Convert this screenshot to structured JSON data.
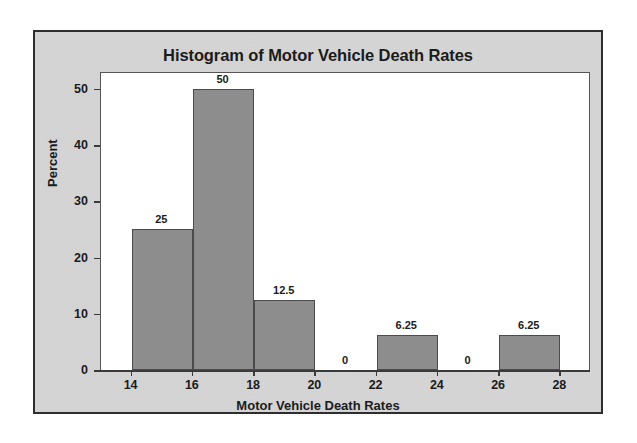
{
  "figure": {
    "background_color": "#d5d5d5",
    "frame_color": "#2e2e2e",
    "plot_background": "#ffffff"
  },
  "chart_data": {
    "type": "bar",
    "title": "Histogram of Motor Vehicle Death Rates",
    "xlabel": "Motor Vehicle Death Rates",
    "ylabel": "Percent",
    "xlim": [
      13.0,
      29.0
    ],
    "ylim": [
      0,
      53
    ],
    "grid": false,
    "legend": "none",
    "bar_color": "#8d8d8d",
    "bar_edge_color": "#4b4b4b",
    "bin_width": 2,
    "xticks": [
      14,
      16,
      18,
      20,
      22,
      24,
      26,
      28
    ],
    "xtick_labels": [
      "14",
      "16",
      "18",
      "20",
      "22",
      "24",
      "26",
      "28"
    ],
    "yticks": [
      0,
      10,
      20,
      30,
      40,
      50
    ],
    "ytick_labels": [
      "0",
      "10",
      "20",
      "30",
      "40",
      "50"
    ],
    "bins": [
      {
        "start": 14,
        "end": 16,
        "value": 25,
        "label": "25"
      },
      {
        "start": 16,
        "end": 18,
        "value": 50,
        "label": "50"
      },
      {
        "start": 18,
        "end": 20,
        "value": 12.5,
        "label": "12.5"
      },
      {
        "start": 20,
        "end": 22,
        "value": 0,
        "label": "0"
      },
      {
        "start": 22,
        "end": 24,
        "value": 6.25,
        "label": "6.25"
      },
      {
        "start": 24,
        "end": 26,
        "value": 0,
        "label": "0"
      },
      {
        "start": 26,
        "end": 28,
        "value": 6.25,
        "label": "6.25"
      }
    ],
    "categories": [
      "14-16",
      "16-18",
      "18-20",
      "20-22",
      "22-24",
      "24-26",
      "26-28"
    ],
    "values": [
      25,
      50,
      12.5,
      0,
      6.25,
      0,
      6.25
    ]
  }
}
